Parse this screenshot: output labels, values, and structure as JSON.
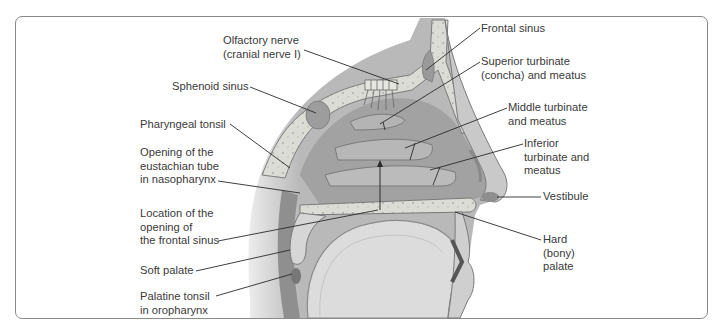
{
  "figure": {
    "frame_color": "#8a8a8a",
    "text_color": "#3a3a3a",
    "leader_color": "#2a2a2a"
  },
  "labels": {
    "olfactory_nerve": {
      "text": "Olfactory nerve\n(cranial nerve I)",
      "x": 223,
      "y": 34,
      "align": "left"
    },
    "sphenoid_sinus": {
      "text": "Sphenoid sinus",
      "x": 172,
      "y": 80,
      "align": "left"
    },
    "pharyngeal_tonsil": {
      "text": "Pharyngeal tonsil",
      "x": 140,
      "y": 118,
      "align": "left"
    },
    "eustachian_opening": {
      "text": "Opening of the\neustachian tube\nin nasopharynx",
      "x": 140,
      "y": 146,
      "align": "left"
    },
    "frontal_sinus_opening": {
      "text": "Location of the\nopening of\nthe frontal sinus",
      "x": 140,
      "y": 207,
      "align": "left"
    },
    "soft_palate": {
      "text": "Soft palate",
      "x": 140,
      "y": 264,
      "align": "left"
    },
    "palatine_tonsil": {
      "text": "Palatine tonsil\nin oropharynx",
      "x": 140,
      "y": 290,
      "align": "left"
    },
    "frontal_sinus": {
      "text": "Frontal sinus",
      "x": 481,
      "y": 22,
      "align": "left"
    },
    "superior_turbinate": {
      "text": "Superior turbinate\n(concha) and meatus",
      "x": 481,
      "y": 55,
      "align": "left"
    },
    "middle_turbinate": {
      "text": "Middle turbinate\nand meatus",
      "x": 508,
      "y": 101,
      "align": "left"
    },
    "inferior_turbinate": {
      "text": "Inferior\nturbinate and\nmeatus",
      "x": 524,
      "y": 137,
      "align": "left"
    },
    "vestibule": {
      "text": "Vestibule",
      "x": 543,
      "y": 190,
      "align": "left"
    },
    "hard_palate": {
      "text": "Hard\n(bony)\npalate",
      "x": 543,
      "y": 233,
      "align": "left"
    }
  },
  "leaders": [
    {
      "id": "olfactory_nerve",
      "x1": 304,
      "y1": 50,
      "x2": 399,
      "y2": 84
    },
    {
      "id": "sphenoid_sinus",
      "x1": 250,
      "y1": 87,
      "x2": 316,
      "y2": 113
    },
    {
      "id": "pharyngeal_tonsil",
      "x1": 230,
      "y1": 124,
      "x2": 290,
      "y2": 168
    },
    {
      "id": "eustachian_opening",
      "x1": 218,
      "y1": 181,
      "x2": 300,
      "y2": 193
    },
    {
      "id": "frontal_sinus_opening",
      "x1": 218,
      "y1": 241,
      "x2": 378,
      "y2": 210
    },
    {
      "id": "soft_palate",
      "x1": 196,
      "y1": 271,
      "x2": 290,
      "y2": 250
    },
    {
      "id": "palatine_tonsil",
      "x1": 216,
      "y1": 296,
      "x2": 292,
      "y2": 274
    },
    {
      "id": "frontal_sinus",
      "x1": 480,
      "y1": 28,
      "x2": 426,
      "y2": 70
    },
    {
      "id": "superior_turbinate",
      "x1": 480,
      "y1": 62,
      "x2": 380,
      "y2": 124
    },
    {
      "id": "middle_turbinate",
      "x1": 507,
      "y1": 108,
      "x2": 405,
      "y2": 148
    },
    {
      "id": "inferior_turbinate",
      "x1": 523,
      "y1": 144,
      "x2": 430,
      "y2": 170
    },
    {
      "id": "vestibule",
      "x1": 541,
      "y1": 197,
      "x2": 497,
      "y2": 197
    },
    {
      "id": "hard_palate",
      "x1": 541,
      "y1": 240,
      "x2": 455,
      "y2": 212
    }
  ],
  "ticks": [
    {
      "id": "superior_turbinate_tick",
      "x1": 383,
      "y1": 122,
      "x2": 385,
      "y2": 130
    },
    {
      "id": "middle_turbinate_tick",
      "x1": 415,
      "y1": 143,
      "x2": 410,
      "y2": 160
    },
    {
      "id": "inferior_turbinate_tick",
      "x1": 440,
      "y1": 167,
      "x2": 433,
      "y2": 185
    }
  ],
  "arrow": {
    "id": "frontal_sinus_drainage_arrow",
    "x": 380,
    "y_top": 160,
    "y_bottom": 210
  }
}
